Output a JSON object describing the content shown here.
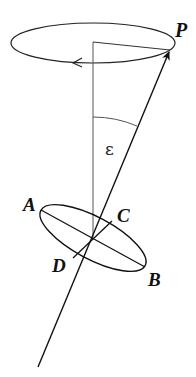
{
  "diagram": {
    "labels": {
      "P": "P",
      "A": "A",
      "B": "B",
      "C": "C",
      "D": "D",
      "epsilon": "ε"
    },
    "colors": {
      "stroke": "#111111",
      "thin_stroke": "#555555",
      "background": "#ffffff"
    },
    "elements": [
      {
        "id": "precession-circle",
        "type": "ellipse",
        "description": "Horizontal circle traced by the axis tip, with leftward arrow indicating rotation direction"
      },
      {
        "id": "vertical-axis",
        "type": "line",
        "description": "Fixed vertical reference axis"
      },
      {
        "id": "radius-line",
        "type": "line",
        "description": "Line from vertical axis top to P"
      },
      {
        "id": "tilted-axis",
        "type": "arrow",
        "description": "Tilted rotation axis pointing to P"
      },
      {
        "id": "epsilon-arc",
        "type": "arc",
        "description": "Angle ε between vertical and tilted axis"
      },
      {
        "id": "equator-ellipse",
        "type": "ellipse",
        "description": "Tilted plane with diameters AB and CD"
      }
    ]
  }
}
